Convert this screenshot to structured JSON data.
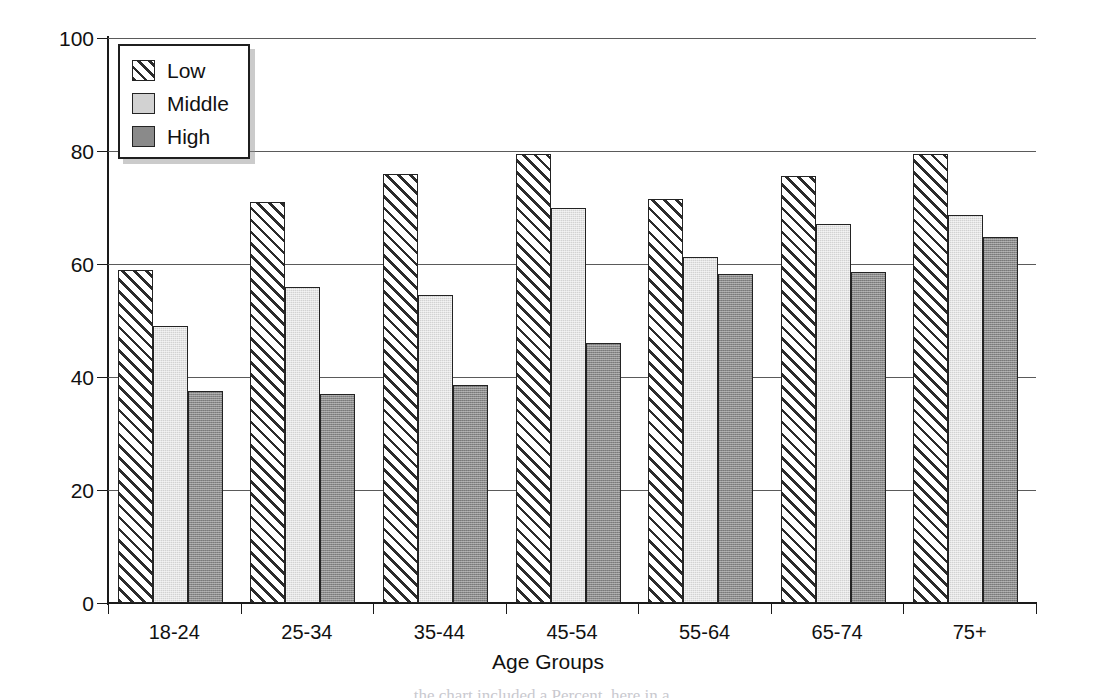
{
  "chart_data": {
    "type": "bar",
    "title": "",
    "subtitle": "",
    "xlabel": "Age Groups",
    "ylabel": "Percent",
    "categories": [
      "18-24",
      "25-34",
      "35-44",
      "45-54",
      "55-64",
      "65-74",
      "75+"
    ],
    "series": [
      {
        "name": "Low",
        "values": [
          59.0,
          71.0,
          76.0,
          79.5,
          71.5,
          75.5,
          79.5
        ]
      },
      {
        "name": "Middle",
        "values": [
          49.0,
          56.0,
          54.5,
          70.0,
          61.3,
          67.0,
          68.7
        ]
      },
      {
        "name": "High",
        "values": [
          37.5,
          37.0,
          38.5,
          46.0,
          58.3,
          58.5,
          64.7
        ]
      }
    ],
    "ylim": [
      0,
      100
    ],
    "yticks": [
      0,
      20,
      40,
      60,
      80,
      100
    ],
    "ytick_labels": [
      "0",
      "20",
      "40",
      "60",
      "80",
      "100"
    ],
    "grid": "horizontal",
    "legend_position": "top-left",
    "legend_entries": [
      {
        "label": "Low",
        "pattern": "diagonal-hatch",
        "color": "#ffffff"
      },
      {
        "label": "Middle",
        "pattern": "solid",
        "color": "#d2d2d2"
      },
      {
        "label": "High",
        "pattern": "solid",
        "color": "#8a8a8a"
      }
    ]
  },
  "figure": {
    "caption_fragment": "the chart included a Percent, here in a..."
  }
}
